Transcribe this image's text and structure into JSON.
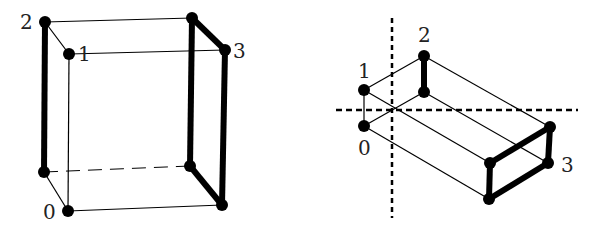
{
  "diagram": {
    "left": {
      "labels": {
        "v0": "0",
        "v1": "1",
        "v2": "2",
        "v3": "3"
      }
    },
    "right": {
      "labels": {
        "v0": "0",
        "v1": "1",
        "v2": "2",
        "v3": "3"
      }
    },
    "colors": {
      "stroke": "#000000",
      "background": "#ffffff"
    }
  }
}
